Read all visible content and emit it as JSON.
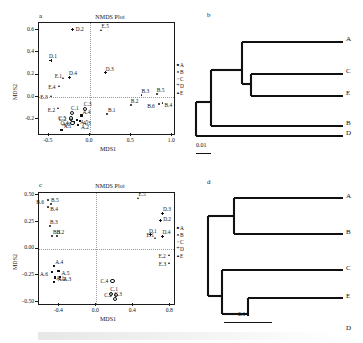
{
  "figure": {
    "panels": [
      "a",
      "b",
      "c",
      "d"
    ],
    "legend_groups": [
      {
        "label": "A",
        "marker": "filled-square"
      },
      {
        "label": "B",
        "marker": "filled-circle"
      },
      {
        "label": "C",
        "marker": "open-circle"
      },
      {
        "label": "D",
        "marker": "plus"
      },
      {
        "label": "E",
        "marker": "triangle"
      }
    ]
  },
  "panel_a": {
    "letter": "a",
    "title": "NMDS Plot",
    "stress": "Stress=0.109",
    "xlabel": "MDS1",
    "ylabel": "MDS2",
    "xticks": [
      "-0.5",
      "0.0",
      "0.5",
      "1.0"
    ],
    "yticks": [
      "0.6",
      "0.4",
      "0.2",
      "0.0",
      "-0.2"
    ]
  },
  "panel_c": {
    "letter": "c",
    "title": "NMDS Plot",
    "stress": "Stress=0.06",
    "xlabel": "MDS1",
    "ylabel": "MDS2",
    "xticks": [
      "-0.4",
      "0.0",
      "0.4",
      "0.8"
    ],
    "yticks": [
      "0.50",
      "0.25",
      "0.00",
      "-0.25",
      "-0.50"
    ]
  },
  "panel_b": {
    "letter": "b",
    "leaves": [
      "A",
      "C",
      "E",
      "B",
      "D"
    ],
    "scale_label": "0.01"
  },
  "panel_d": {
    "letter": "d",
    "leaves": [
      "A",
      "B",
      "C",
      "E",
      "D"
    ],
    "scale_label": "0.1"
  },
  "chart_data": [
    {
      "type": "scatter",
      "panel": "a",
      "title": "NMDS Plot",
      "xlabel": "MDS1",
      "ylabel": "MDS2",
      "xlim": [
        -0.62,
        1.02
      ],
      "ylim": [
        -0.33,
        0.66
      ],
      "xticks": [
        -0.5,
        0.0,
        0.5,
        1.0
      ],
      "yticks": [
        -0.2,
        0.0,
        0.2,
        0.4,
        0.6
      ],
      "grid": "dotted-crosshair-at-origin",
      "annotation": "Stress=0.109",
      "series": [
        {
          "name": "A",
          "marker": "filled-square",
          "points": [
            {
              "label": "A.1",
              "x": -0.345,
              "y": -0.295
            },
            {
              "label": "A.2",
              "x": -0.145,
              "y": -0.25
            },
            {
              "label": "A.3",
              "x": -0.125,
              "y": -0.215
            },
            {
              "label": "A.4",
              "x": -0.105,
              "y": -0.165
            },
            {
              "label": "A.5",
              "x": -0.155,
              "y": -0.205
            },
            {
              "label": "A.6",
              "x": -0.195,
              "y": -0.225
            }
          ]
        },
        {
          "name": "B",
          "marker": "filled-circle",
          "points": [
            {
              "label": "B.1",
              "x": 0.205,
              "y": -0.15
            },
            {
              "label": "B.2",
              "x": 0.495,
              "y": -0.075
            },
            {
              "label": "B.3",
              "x": 0.625,
              "y": 0.02
            },
            {
              "label": "B.4",
              "x": 0.88,
              "y": -0.055
            },
            {
              "label": "B.5",
              "x": 0.81,
              "y": 0.025
            },
            {
              "label": "B.6",
              "x": 0.84,
              "y": -0.06
            }
          ]
        },
        {
          "name": "C",
          "marker": "open-circle",
          "points": [
            {
              "label": "C.1",
              "x": -0.23,
              "y": -0.135
            },
            {
              "label": "C.2",
              "x": -0.245,
              "y": -0.185
            },
            {
              "label": "C.3",
              "x": -0.075,
              "y": -0.1
            },
            {
              "label": "C.4",
              "x": -0.225,
              "y": -0.22
            },
            {
              "label": "C.5",
              "x": -0.24,
              "y": -0.175
            }
          ]
        },
        {
          "name": "D",
          "marker": "plus",
          "points": [
            {
              "label": "D.1",
              "x": -0.475,
              "y": 0.33
            },
            {
              "label": "D.2",
              "x": -0.21,
              "y": 0.6
            },
            {
              "label": "D.3",
              "x": 0.19,
              "y": 0.215
            },
            {
              "label": "D.4",
              "x": -0.255,
              "y": 0.175
            }
          ]
        },
        {
          "name": "E",
          "marker": "triangle",
          "points": [
            {
              "label": "E.1",
              "x": -0.32,
              "y": 0.165
            },
            {
              "label": "E.2",
              "x": -0.38,
              "y": -0.105
            },
            {
              "label": "E.3",
              "x": -0.47,
              "y": 0.01
            },
            {
              "label": "E.4",
              "x": -0.375,
              "y": 0.095
            },
            {
              "label": "E.5",
              "x": 0.14,
              "y": 0.595
            }
          ]
        }
      ]
    },
    {
      "type": "scatter",
      "panel": "c",
      "title": "NMDS Plot",
      "xlabel": "MDS1",
      "ylabel": "MDS2",
      "xlim": [
        -0.62,
        0.84
      ],
      "ylim": [
        -0.52,
        0.52
      ],
      "xticks": [
        -0.4,
        0.0,
        0.4,
        0.8
      ],
      "yticks": [
        -0.5,
        -0.25,
        0.0,
        0.25,
        0.5
      ],
      "grid": "dotted-crosshair-at-origin",
      "annotation": "Stress=0.06",
      "series": [
        {
          "name": "A",
          "marker": "filled-square",
          "points": [
            {
              "label": "A.1",
              "x": -0.455,
              "y": -0.315
            },
            {
              "label": "A.2",
              "x": -0.45,
              "y": -0.27
            },
            {
              "label": "A.3",
              "x": -0.39,
              "y": -0.265
            },
            {
              "label": "A.4",
              "x": -0.455,
              "y": -0.165
            },
            {
              "label": "A.5",
              "x": -0.41,
              "y": -0.21
            },
            {
              "label": "A.6",
              "x": -0.48,
              "y": -0.22
            }
          ]
        },
        {
          "name": "B",
          "marker": "filled-circle",
          "points": [
            {
              "label": "B.1",
              "x": -0.48,
              "y": 0.12
            },
            {
              "label": "B.2",
              "x": -0.43,
              "y": 0.115
            },
            {
              "label": "B.3",
              "x": -0.5,
              "y": 0.215
            },
            {
              "label": "B.4",
              "x": -0.52,
              "y": 0.39
            },
            {
              "label": "B.5",
              "x": -0.49,
              "y": 0.42
            },
            {
              "label": "B.6",
              "x": -0.52,
              "y": 0.455
            }
          ]
        },
        {
          "name": "C",
          "marker": "open-circle",
          "points": [
            {
              "label": "C.1",
              "x": 0.15,
              "y": -0.415
            },
            {
              "label": "C.2",
              "x": 0.205,
              "y": -0.425
            },
            {
              "label": "C.3",
              "x": 0.195,
              "y": -0.465
            },
            {
              "label": "C.4",
              "x": 0.165,
              "y": -0.295
            }
          ]
        },
        {
          "name": "D",
          "marker": "plus",
          "points": [
            {
              "label": "D.1",
              "x": 0.59,
              "y": 0.13
            },
            {
              "label": "D.2",
              "x": 0.69,
              "y": 0.265
            },
            {
              "label": "D.3",
              "x": 0.72,
              "y": 0.33
            },
            {
              "label": "D.4",
              "x": 0.715,
              "y": 0.115
            }
          ]
        },
        {
          "name": "E",
          "marker": "triangle",
          "points": [
            {
              "label": "E.1",
              "x": 0.64,
              "y": 0.095
            },
            {
              "label": "E.2",
              "x": 0.79,
              "y": -0.06
            },
            {
              "label": "E.3",
              "x": 0.795,
              "y": -0.14
            },
            {
              "label": "E.5",
              "x": 0.455,
              "y": 0.475
            }
          ]
        }
      ]
    },
    {
      "type": "dendrogram",
      "panel": "b",
      "leaves": [
        "A",
        "C",
        "E",
        "B",
        "D"
      ],
      "scale_label": "0.01"
    },
    {
      "type": "dendrogram",
      "panel": "d",
      "leaves": [
        "A",
        "B",
        "C",
        "E",
        "D"
      ],
      "scale_label": "0.1"
    }
  ]
}
